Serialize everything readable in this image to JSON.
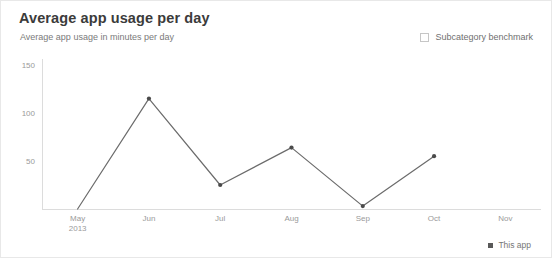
{
  "header": {
    "title": "Average app usage per day",
    "subtitle": "Average app usage in minutes per day"
  },
  "benchmark": {
    "label": "Subcategory benchmark",
    "checked": false,
    "icon": "checkbox-unchecked-icon"
  },
  "legend": {
    "series_label": "This app",
    "marker_color": "#595959"
  },
  "colors": {
    "line": "#6b6b6b",
    "marker": "#4a4a4a",
    "axis": "#dcdcdc",
    "tick_text": "#9a9a9a",
    "title": "#3b3b3b",
    "subtitle": "#7a7a7a",
    "background": "#ffffff"
  },
  "chart_data": {
    "type": "line",
    "title": "Average app usage per day",
    "subtitle": "Average app usage in minutes per day",
    "xlabel": "",
    "ylabel": "",
    "categories": [
      "May\n2013",
      "Jun",
      "Jul",
      "Aug",
      "Sep",
      "Oct",
      "Nov"
    ],
    "x_tick_labels": [
      "May",
      "Jun",
      "Jul",
      "Aug",
      "Sep",
      "Oct",
      "Nov"
    ],
    "x_tick_sublabels": [
      "2013",
      "",
      "",
      "",
      "",
      "",
      ""
    ],
    "y_tick_labels": [
      "50",
      "100",
      "150"
    ],
    "y_ticks": [
      50,
      100,
      150
    ],
    "ylim": [
      0,
      150
    ],
    "grid": false,
    "legend_position": "bottom-right",
    "series": [
      {
        "name": "This app",
        "values": [
          0,
          115,
          25,
          64,
          3,
          55,
          null
        ]
      }
    ]
  }
}
